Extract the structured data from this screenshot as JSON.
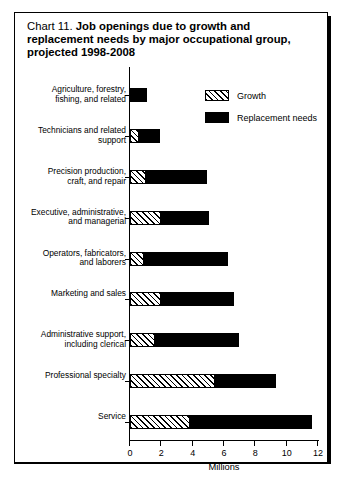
{
  "title": {
    "prefix": "Chart 11.",
    "bold": "Job openings due to growth and replacement needs by major occupational group, projected 1998-2008"
  },
  "legend": {
    "items": [
      {
        "label": "Growth",
        "swatch": "hatched-swatch"
      },
      {
        "label": "Replacement needs",
        "swatch": "solid-black-swatch"
      }
    ]
  },
  "chart_data": {
    "type": "bar",
    "orientation": "horizontal",
    "stacked": true,
    "title": "Chart 11. Job openings due to growth and replacement needs by major occupational group, projected 1998-2008",
    "xlabel": "Millions",
    "ylabel": "",
    "xlim": [
      0,
      12
    ],
    "xticks": [
      0,
      2,
      4,
      6,
      8,
      10,
      12
    ],
    "xticklabels": [
      "0",
      "2",
      "4",
      "6",
      "8",
      "10",
      "12"
    ],
    "grid": false,
    "legend_position": "top-right",
    "categories": [
      "Agriculture, forestry,\nfishing, and related",
      "Technicians and related\nsupport",
      "Precision production,\ncraft, and repair",
      "Executive, administrative,\nand managerial",
      "Operators, fabricators,\nand laborers",
      "Marketing and sales",
      "Administrative support,\nincluding clerical",
      "Professional specialty",
      "Service"
    ],
    "series": [
      {
        "name": "Growth",
        "values": [
          0.0,
          0.6,
          1.0,
          2.0,
          0.9,
          2.0,
          1.6,
          5.4,
          3.8
        ]
      },
      {
        "name": "Replacement needs",
        "values": [
          1.1,
          1.4,
          4.0,
          3.1,
          5.4,
          4.7,
          5.4,
          4.0,
          7.9
        ]
      }
    ],
    "totals": [
      1.1,
      2.0,
      5.0,
      5.1,
      6.3,
      6.7,
      7.0,
      9.4,
      11.7
    ]
  },
  "colors": {
    "growth_fill": "#ffffff",
    "growth_hatch": "#000000",
    "replacement_fill": "#000000",
    "axis": "#000000",
    "background": "#ffffff"
  }
}
